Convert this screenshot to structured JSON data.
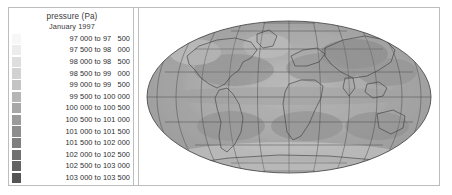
{
  "figure": {
    "name": "global-mean-sea-level-pressure-map",
    "background_color": "#ffffff",
    "frame_color": "#bdbdbd"
  },
  "legend": {
    "title": "pressure (Pa)",
    "subtitle": "January 1997",
    "separator": " to ",
    "rows": [
      {
        "label": "97 000 to 97   500",
        "from": 97000,
        "to": 97500,
        "color": "#f7f7f7"
      },
      {
        "label": "97 500 to 98   000",
        "from": 97500,
        "to": 98000,
        "color": "#ececec"
      },
      {
        "label": "98 000 to 98   500",
        "from": 98000,
        "to": 98500,
        "color": "#dedede"
      },
      {
        "label": "98 500 to 99   000",
        "from": 98500,
        "to": 99000,
        "color": "#d2d2d2"
      },
      {
        "label": "99 000 to 99   500",
        "from": 99000,
        "to": 99500,
        "color": "#c4c4c4"
      },
      {
        "label": "99 500 to 100 000",
        "from": 99500,
        "to": 100000,
        "color": "#b6b6b6"
      },
      {
        "label": "100 000 to 100 500",
        "from": 100000,
        "to": 100500,
        "color": "#a8a8a8"
      },
      {
        "label": "100 500 to 101 000",
        "from": 100500,
        "to": 101000,
        "color": "#9b9b9b"
      },
      {
        "label": "101 000 to 101 500",
        "from": 101000,
        "to": 101500,
        "color": "#8d8d8d"
      },
      {
        "label": "101 500 to 102 000",
        "from": 101500,
        "to": 102000,
        "color": "#7f7f7f"
      },
      {
        "label": "102 000 to 102 500",
        "from": 102000,
        "to": 102500,
        "color": "#717171"
      },
      {
        "label": "102 500 to 103 000",
        "from": 102500,
        "to": 103000,
        "color": "#636363"
      },
      {
        "label": "103 000 to 103 500",
        "from": 103000,
        "to": 103500,
        "color": "#555555"
      }
    ]
  },
  "chart_data": {
    "type": "heatmap",
    "title": "pressure (Pa)",
    "subtitle": "January 1997",
    "projection": "mollweide",
    "xlabel": "longitude",
    "ylabel": "latitude",
    "xlim": [
      -180,
      180
    ],
    "ylim": [
      -90,
      90
    ],
    "grid": true,
    "graticule_spacing_deg": {
      "longitude": 30,
      "latitude": 30
    },
    "legend_position": "left-panel",
    "units": "Pa",
    "variable": "mean sea level pressure",
    "value_range": [
      97000,
      103500
    ],
    "bin_width": 500,
    "colormap": "grayscale-light-to-dark",
    "categories": [
      "97 000 to 97 500",
      "97 500 to 98 000",
      "98 000 to 98 500",
      "98 500 to 99 000",
      "99 000 to 99 500",
      "99 500 to 100 000",
      "100 000 to 100 500",
      "100 500 to 101 000",
      "101 000 to 101 500",
      "101 500 to 102 000",
      "102 000 to 102 500",
      "102 500 to 103 000",
      "103 000 to 103 500"
    ],
    "bin_lower_bounds": [
      97000,
      97500,
      98000,
      98500,
      99000,
      99500,
      100000,
      100500,
      101000,
      101500,
      102000,
      102500,
      103000
    ],
    "bin_upper_bounds": [
      97500,
      98000,
      98500,
      99000,
      99500,
      100000,
      100500,
      101000,
      101500,
      102000,
      102500,
      103000,
      103500
    ],
    "bin_colors": [
      "#f7f7f7",
      "#ececec",
      "#dedede",
      "#d2d2d2",
      "#c4c4c4",
      "#b6b6b6",
      "#a8a8a8",
      "#9b9b9b",
      "#8d8d8d",
      "#7f7f7f",
      "#717171",
      "#636363",
      "#555555"
    ],
    "field_samples": [
      {
        "region": "Siberia high",
        "lon": 100,
        "lat": 55,
        "value": 102750
      },
      {
        "region": "North Pacific low (Aleutian)",
        "lon": -175,
        "lat": 52,
        "value": 100250
      },
      {
        "region": "North Atlantic low (Icelandic)",
        "lon": -25,
        "lat": 62,
        "value": 100250
      },
      {
        "region": "Azores high",
        "lon": -30,
        "lat": 32,
        "value": 102250
      },
      {
        "region": "Pacific subtropical high",
        "lon": -140,
        "lat": 32,
        "value": 102250
      },
      {
        "region": "Equatorial trough",
        "lon": 0,
        "lat": 0,
        "value": 101250
      },
      {
        "region": "South Atlantic high",
        "lon": -10,
        "lat": -30,
        "value": 102250
      },
      {
        "region": "South Indian high",
        "lon": 80,
        "lat": -32,
        "value": 102250
      },
      {
        "region": "South Pacific high",
        "lon": -100,
        "lat": -32,
        "value": 102250
      },
      {
        "region": "Southern Ocean trough",
        "lon": 60,
        "lat": -62,
        "value": 99250
      },
      {
        "region": "Antarctic plateau",
        "lon": 0,
        "lat": -85,
        "value": 98250
      }
    ]
  }
}
